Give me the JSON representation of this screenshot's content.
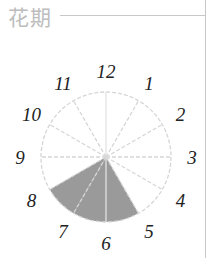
{
  "header": {
    "title": "花期"
  },
  "chart_data": {
    "type": "clock-sector",
    "title": "花期",
    "categories": [
      "1",
      "2",
      "3",
      "4",
      "5",
      "6",
      "7",
      "8",
      "9",
      "10",
      "11",
      "12"
    ],
    "highlighted": [
      "6",
      "7",
      "8"
    ],
    "values": [
      0,
      0,
      0,
      0,
      0,
      1,
      1,
      1,
      0,
      0,
      0,
      0
    ],
    "colors": {
      "fill": "#9a9a9a",
      "grid": "#d6d6d6",
      "label": "#222222"
    }
  },
  "labels": [
    "12",
    "1",
    "2",
    "3",
    "4",
    "5",
    "6",
    "7",
    "8",
    "9",
    "10",
    "11"
  ]
}
